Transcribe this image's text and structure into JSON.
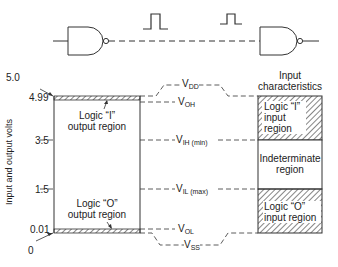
{
  "diagram": {
    "top": {
      "gates": [
        "NAND gate (driver)",
        "NAND gate (receiver)"
      ],
      "pulses": 2
    },
    "axis": {
      "title": "Input and output volts",
      "ticks": [
        "5.0",
        "4.99",
        "3.5",
        "1.5",
        "0.01",
        "0"
      ]
    },
    "output_box": {
      "logic1_label_line1": "Logic “I”",
      "logic1_label_line2": "output region",
      "logic0_label_line1": "Logic “O”",
      "logic0_label_line2": "output region"
    },
    "levels": {
      "vdd": "V",
      "vdd_sub": "DD",
      "voh": "V",
      "voh_sub": "OH",
      "vih": "V",
      "vih_sub": "IH (min)",
      "vil": "V",
      "vil_sub": "IL (max)",
      "vol": "V",
      "vol_sub": "OL",
      "vss": "V",
      "vss_sub": "SS"
    },
    "input_box": {
      "title_line1": "Input",
      "title_line2": "characteristics",
      "logic1_line1": "Logic “I”",
      "logic1_line2": "input",
      "logic1_line3": "region",
      "indeterminate_line1": "Indeterminate",
      "indeterminate_line2": "region",
      "logic0_line1": "Logic “O”",
      "logic0_line2": "input region"
    }
  }
}
